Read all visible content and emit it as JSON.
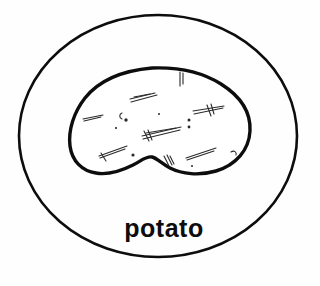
{
  "image": {
    "title": "potato",
    "kind": "hand-drawn sketch",
    "background_color": "#fefefe",
    "ink_color": "#0d0d0d",
    "width": 320,
    "height": 286
  },
  "label": {
    "text": "potato",
    "x": 164,
    "y": 237,
    "font_size": 25,
    "color": "#0d0d0d"
  },
  "shapes": {
    "outer_ellipse": {
      "name": "outer-ellipse",
      "cx": 158,
      "cy": 136,
      "rx": 139,
      "ry": 121,
      "stroke_color": "#0d0d0d",
      "stroke_width": 2.6,
      "fill": "none"
    },
    "potato_outline": {
      "name": "potato-outline",
      "stroke_color": "#0d0d0d",
      "stroke_width": 3.4,
      "fill": "#ffffff",
      "bounds": {
        "left": 70,
        "top": 67,
        "right": 251,
        "bottom": 176
      },
      "path": "M 152 68 C 178 67 202 72 221 84 C 240 96 251 112 250 131 C 249 150 236 165 216 171 C 199 176 182 174 170 168 C 162 164 157 158 152 157 C 146 156 141 161 133 165 C 121 171 107 175 96 173 C 82 171 72 161 70 146 C 68 130 74 112 85 98 C 97 83 118 71 152 68 Z"
    }
  },
  "texture_marks": {
    "name": "potato-interior-texture",
    "color": "#2a2a2a",
    "strokes": [
      {
        "id": "mark-top-center",
        "d": "M 130 99 L 155 93"
      },
      {
        "id": "mark-top-center-b",
        "d": "M 131 102 L 157 95"
      },
      {
        "id": "mark-top-center-c",
        "d": "M 134 97 L 150 94"
      },
      {
        "id": "mark-left-upper",
        "d": "M 83 119 L 103 115"
      },
      {
        "id": "mark-left-upper-b",
        "d": "M 84 121 L 101 117"
      },
      {
        "id": "mark-center-long",
        "d": "M 142 136 L 181 127"
      },
      {
        "id": "mark-center-long-b",
        "d": "M 143 139 L 180 130"
      },
      {
        "id": "mark-center-long-c",
        "d": "M 146 133 L 176 128"
      },
      {
        "id": "mark-center-tick1",
        "d": "M 144 131 L 149 141"
      },
      {
        "id": "mark-center-tick2",
        "d": "M 148 130 L 152 140"
      },
      {
        "id": "mark-right-upper",
        "d": "M 193 111 L 224 106"
      },
      {
        "id": "mark-right-upper-b",
        "d": "M 194 114 L 223 108"
      },
      {
        "id": "mark-right-upper-tick",
        "d": "M 207 105 L 211 116"
      },
      {
        "id": "mark-right-upper-tick2",
        "d": "M 211 104 L 214 114"
      },
      {
        "id": "mark-bottom-left",
        "d": "M 99 156 L 127 146"
      },
      {
        "id": "mark-bottom-left-b",
        "d": "M 100 158 L 125 149"
      },
      {
        "id": "mark-bottom-left-tick",
        "d": "M 101 153 L 106 161"
      },
      {
        "id": "mark-bottom-right",
        "d": "M 186 158 L 216 148"
      },
      {
        "id": "mark-bottom-right-b",
        "d": "M 187 160 L 214 151"
      },
      {
        "id": "mark-notch-a",
        "d": "M 164 156 L 169 166"
      },
      {
        "id": "mark-notch-b",
        "d": "M 167 155 L 172 165"
      },
      {
        "id": "mark-notch-c",
        "d": "M 170 156 L 174 164"
      },
      {
        "id": "mark-top-tick-a",
        "d": "M 180 72 L 180 86"
      },
      {
        "id": "mark-top-tick-b",
        "d": "M 183 73 L 183 84"
      }
    ],
    "dots": [
      {
        "id": "dot-eye-1",
        "cx": 126,
        "cy": 120,
        "r": 1.7
      },
      {
        "id": "dot-eye-2",
        "cx": 116,
        "cy": 128,
        "r": 1.1
      },
      {
        "id": "dot-eye-3",
        "cx": 189,
        "cy": 120,
        "r": 1.5
      },
      {
        "id": "dot-eye-4",
        "cx": 189,
        "cy": 127,
        "r": 1.4
      },
      {
        "id": "dot-eye-5",
        "cx": 133,
        "cy": 155,
        "r": 1.6
      },
      {
        "id": "dot-eye-6",
        "cx": 192,
        "cy": 166,
        "r": 1.0
      },
      {
        "id": "dot-eye-7",
        "cx": 159,
        "cy": 114,
        "r": 1.0
      }
    ],
    "eye_curves": [
      {
        "id": "eye-curve-left",
        "d": "M 122 113 c -3 1 -3 5 0 6"
      },
      {
        "id": "eye-curve-right",
        "d": "M 231 152 c 3 -2 6 0 5 3"
      }
    ]
  }
}
